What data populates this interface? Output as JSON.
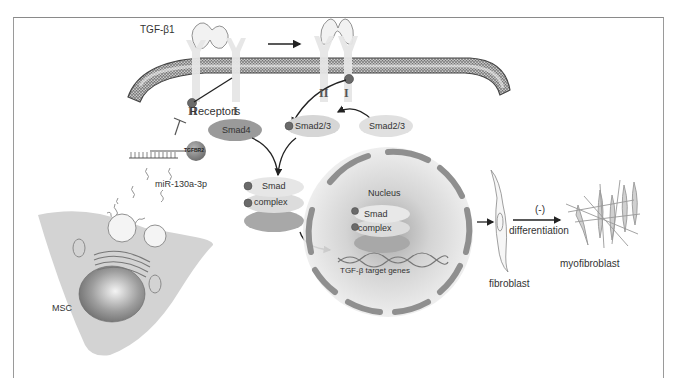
{
  "figure": {
    "ligand_label": "TGF-β1",
    "receptors_label": "Receptors",
    "receptor_type_II": "II",
    "receptor_type_I": "I",
    "receptor_type_II_active": "II",
    "receptor_type_I_active": "I",
    "tgfbr2_label": "TGFBR2",
    "mirna_label": "miR-130a-3p",
    "msc_label": "MSC",
    "smad4_label": "Smad4",
    "smad23_phospho_label": "Smad2/3",
    "smad23_label": "Smad2/3",
    "smad_complex_label_1": "Smad",
    "smad_complex_label_2": "complex",
    "nucleus_label": "Nucleus",
    "nuclear_smad_label_1": "Smad",
    "nuclear_smad_label_2": "complex",
    "target_genes_label": "TGF-β target genes",
    "fibroblast_label": "fibroblast",
    "inhibition_label": "(-)",
    "differentiation_label": "differentiation",
    "myofibroblast_label": "myofibroblast"
  },
  "colors": {
    "membrane_dark": "#5a5a5a",
    "membrane_light": "#d8d8d8",
    "receptor": "#e6e6e6",
    "smad4": "#9a9a9a",
    "smad23": "#d4d4d4",
    "nucleus_envelope": "#8f8f8f",
    "cell_body": "#d3d3d3",
    "phospho": "#6a6a6a",
    "arrow": "#222222",
    "frame": "#8a8a8a"
  }
}
